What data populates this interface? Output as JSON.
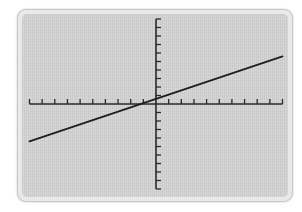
{
  "colors": {
    "frame": "#e9e9e9",
    "screen": "#d4d4d4",
    "axis": "#2a2a2a",
    "line": "#1e1e1e"
  },
  "chart_data": {
    "type": "line",
    "title": "",
    "xlabel": "",
    "ylabel": "",
    "xlim": [
      -10,
      10
    ],
    "ylim": [
      -10,
      10
    ],
    "grid": false,
    "legend": null,
    "tick_labels": false,
    "x_ticks": [
      -10,
      -9,
      -8,
      -7,
      -6,
      -5,
      -4,
      -3,
      -2,
      -1,
      0,
      1,
      2,
      3,
      4,
      5,
      6,
      7,
      8,
      9,
      10
    ],
    "y_ticks": [
      -10,
      -9,
      -8,
      -7,
      -6,
      -5,
      -4,
      -3,
      -2,
      -1,
      0,
      1,
      2,
      3,
      4,
      5,
      6,
      7,
      8,
      9,
      10
    ],
    "series": [
      {
        "name": "line",
        "equation": "y = 0.5x + 0.6",
        "x": [
          -10,
          10
        ],
        "y": [
          -4.4,
          5.6
        ]
      }
    ],
    "x_intercept": -1.2,
    "y_intercept": 0.6
  },
  "layout": {
    "origin_px": [
      156,
      104
    ],
    "x_unit_px": 12.65,
    "y_unit_px": 8.5
  }
}
